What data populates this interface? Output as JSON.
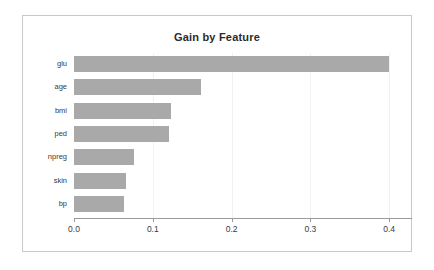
{
  "chart_data": {
    "type": "bar",
    "orientation": "horizontal",
    "title": "Gain by Feature",
    "xlabel": "",
    "ylabel": "",
    "xlim": [
      0.0,
      0.43
    ],
    "grid": true,
    "legend": null,
    "bar_color": "#a9a9a9",
    "categories": [
      "glu",
      "age",
      "bmi",
      "ped",
      "npreg",
      "skin",
      "bp"
    ],
    "values": [
      0.4,
      0.161,
      0.123,
      0.12,
      0.076,
      0.066,
      0.063
    ],
    "xticks": [
      0.0,
      0.1,
      0.2,
      0.3,
      0.4
    ],
    "xticklabels": [
      "0.0",
      "0.1",
      "0.2",
      "0.3",
      "0.4"
    ],
    "gridlines": [
      0.1,
      0.2,
      0.3,
      0.4
    ],
    "bars": [
      {
        "label": "glu",
        "value": 0.4
      },
      {
        "label": "age",
        "value": 0.161
      },
      {
        "label": "bmi",
        "value": 0.123
      },
      {
        "label": "ped",
        "value": 0.12
      },
      {
        "label": "npreg",
        "value": 0.076
      },
      {
        "label": "skin",
        "value": 0.066
      },
      {
        "label": "bp",
        "value": 0.063
      }
    ]
  },
  "frame": {
    "border_color": "#c9c9c9",
    "background": "#ffffff"
  }
}
